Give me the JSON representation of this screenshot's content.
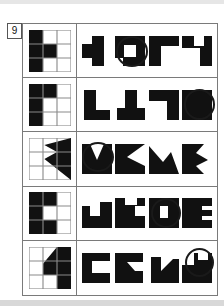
{
  "page": {
    "item_number": "9",
    "ink_color": "#111111",
    "grid_line_color": "#7a7a7a",
    "paper_color": "#ffffff",
    "mark_color": "#1a1a1a"
  },
  "test": {
    "type": "figure-rotation-multiple-choice",
    "row_count": 5,
    "options_per_row": 4,
    "rows": [
      {
        "id": "row-1",
        "prompt_label": "grid-pattern-h-shape",
        "prompt_description": "3x3 grid, left column filled plus centre cell filled",
        "prompt_filled_cells": [
          0,
          3,
          4,
          6
        ],
        "options": [
          {
            "id": "r1-o1",
            "label": "option-1",
            "marked": false
          },
          {
            "id": "r1-o2",
            "label": "option-2",
            "marked": true
          },
          {
            "id": "r1-o3",
            "label": "option-3",
            "marked": false
          },
          {
            "id": "r1-o4",
            "label": "option-4",
            "marked": false
          }
        ],
        "selected_option": 2
      },
      {
        "id": "row-2",
        "prompt_label": "grid-pattern-corner-shape",
        "prompt_description": "3x3 grid, top-left, top-centre and left column filled",
        "prompt_filled_cells": [
          0,
          1,
          3,
          6
        ],
        "options": [
          {
            "id": "r2-o1",
            "label": "option-1",
            "marked": false
          },
          {
            "id": "r2-o2",
            "label": "option-2",
            "marked": false
          },
          {
            "id": "r2-o3",
            "label": "option-3",
            "marked": false
          },
          {
            "id": "r2-o4",
            "label": "option-4",
            "marked": true
          }
        ],
        "selected_option": 4
      },
      {
        "id": "row-3",
        "prompt_label": "grid-pattern-arrow-shape",
        "prompt_description": "3x3 grid with a solid arrow/triangle wedge on the right",
        "prompt_filled_cells": [],
        "options": [
          {
            "id": "r3-o1",
            "label": "option-1",
            "marked": true
          },
          {
            "id": "r3-o2",
            "label": "option-2",
            "marked": false
          },
          {
            "id": "r3-o3",
            "label": "option-3",
            "marked": false
          },
          {
            "id": "r3-o4",
            "label": "option-4",
            "marked": false
          }
        ],
        "selected_option": 1
      },
      {
        "id": "row-4",
        "prompt_label": "grid-pattern-e-shape",
        "prompt_description": "3x3 grid, left column filled plus centre-top and centre-bottom cells",
        "prompt_filled_cells": [
          0,
          1,
          3,
          6,
          7
        ],
        "options": [
          {
            "id": "r4-o1",
            "label": "option-1",
            "marked": false
          },
          {
            "id": "r4-o2",
            "label": "option-2",
            "marked": false
          },
          {
            "id": "r4-o3",
            "label": "option-3",
            "marked": true
          },
          {
            "id": "r4-o4",
            "label": "option-4",
            "marked": false
          }
        ],
        "selected_option": 3
      },
      {
        "id": "row-5",
        "prompt_label": "grid-pattern-diagonal-shape",
        "prompt_description": "3x3 grid with solid block on right and a diagonal step edge",
        "prompt_filled_cells": [],
        "options": [
          {
            "id": "r5-o1",
            "label": "option-1",
            "marked": false
          },
          {
            "id": "r5-o2",
            "label": "option-2",
            "marked": false
          },
          {
            "id": "r5-o3",
            "label": "option-3",
            "marked": false
          },
          {
            "id": "r5-o4",
            "label": "option-4",
            "marked": true
          }
        ],
        "selected_option": 4
      }
    ]
  }
}
